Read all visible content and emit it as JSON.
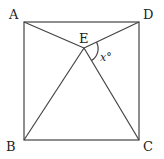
{
  "diagram": {
    "type": "geometry",
    "shape": "square",
    "points": {
      "A": {
        "label": "A",
        "x": 24,
        "y": 22
      },
      "D": {
        "label": "D",
        "x": 139,
        "y": 22
      },
      "B": {
        "label": "B",
        "x": 24,
        "y": 140
      },
      "C": {
        "label": "C",
        "x": 139,
        "y": 140
      },
      "E": {
        "label": "E",
        "x": 84,
        "y": 48
      }
    },
    "segments": [
      "AD",
      "DC",
      "CB",
      "BA",
      "AE",
      "DE",
      "BE",
      "CE"
    ],
    "angle": {
      "label": "x°",
      "vertex": "E",
      "between": [
        "D",
        "C"
      ]
    }
  }
}
